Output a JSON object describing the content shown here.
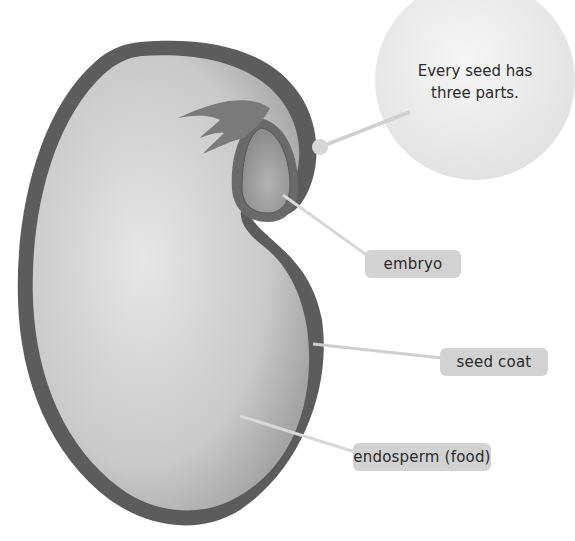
{
  "diagram": {
    "callout": "Every seed has three parts.",
    "labels": {
      "embryo": "embryo",
      "seed_coat": "seed coat",
      "endosperm": "endosperm (food)"
    },
    "colors": {
      "seed_coat": "#5a5a5a",
      "endosperm_light": "#e2e2e2",
      "endosperm_dark": "#a8a8a8",
      "embryo": "#8a8a8a",
      "leaf": "#7a7a7a",
      "label_bg": "#d2d2d2",
      "pointer_line": "#c8c8c8",
      "bubble": "#ececec"
    }
  }
}
